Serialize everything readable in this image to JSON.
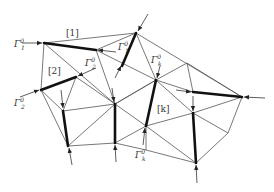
{
  "diagram": {
    "labels": {
      "sub1": "[1]",
      "sub2": "[2]",
      "subk": "[k]",
      "gamma1_left": "Γ",
      "gamma1_left_sup": "0",
      "gamma1_left_sub": "1",
      "gamma1_mid": "Γ",
      "gamma1_mid_sup": "0",
      "gamma1_mid_sub": "1",
      "gamma2_left": "Γ",
      "gamma2_left_sup": "0",
      "gamma2_left_sub": "2",
      "gamma2_mid": "Γ",
      "gamma2_mid_sup": "0",
      "gamma2_mid_sub": "2",
      "gammak_top": "Γ",
      "gammak_top_sup": "0",
      "gammak_top_sub": "k",
      "gammak_bot": "Γ",
      "gammak_bot_sup": "0",
      "gammak_bot_sub": "k"
    },
    "colors": {
      "thin_edge": "#555555",
      "thick_edge": "#111111",
      "text": "#333333"
    }
  }
}
